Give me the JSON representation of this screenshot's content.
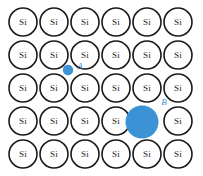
{
  "figure": {
    "name": "silicon-lattice-dopant-diagram",
    "background_color": "#ffffff",
    "width": 203,
    "height": 176
  },
  "lattice": {
    "atom_label": "Si",
    "atom_text_color": "#1a1a1a",
    "atom_fill": "#ffffff",
    "atom_stroke": "#1a1a1a",
    "rows": 5,
    "columns": 6,
    "radius": 14,
    "col_centers": [
      23,
      54,
      85,
      116,
      147,
      178
    ],
    "row_centers": [
      22,
      55,
      88,
      121,
      154
    ],
    "atoms": [
      [
        "Si",
        "Si",
        "Si",
        "Si",
        "Si",
        "Si"
      ],
      [
        "Si",
        "Si",
        "Si",
        "Si",
        "Si",
        "Si"
      ],
      [
        "Si",
        "Si",
        "Si",
        "Si",
        "Si",
        "Si"
      ],
      [
        "Si",
        "Si",
        "Si",
        "Si",
        null,
        "Si"
      ],
      [
        "Si",
        "Si",
        "Si",
        "Si",
        "Si",
        "Si"
      ]
    ]
  },
  "dopants": [
    {
      "id": "A",
      "label": "A",
      "kind": "interstitial-small-dopant",
      "color": "#3b92d4",
      "label_color": "#3b92d4",
      "cx": 68,
      "cy": 70,
      "r": 5.2,
      "label_x": 80,
      "label_y": 67
    },
    {
      "id": "B",
      "label": "B",
      "kind": "substitutional-large-dopant",
      "color": "#3b92d4",
      "label_color": "#3b92d4",
      "cx": 142,
      "cy": 122,
      "r": 16.5,
      "label_x": 164,
      "label_y": 103
    }
  ]
}
